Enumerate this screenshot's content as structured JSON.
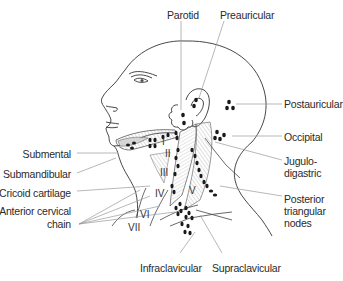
{
  "diagram": {
    "labels": {
      "parotid": "Parotid",
      "preauricular": "Preauricular",
      "postauricular": "Postauricular",
      "occipital": "Occipital",
      "jugulodigastric_1": "Jugulo-",
      "jugulodigastric_2": "digastric",
      "posterior_triangular_1": "Posterior",
      "posterior_triangular_2": "triangular",
      "posterior_triangular_3": "nodes",
      "submental": "Submental",
      "submandibular": "Submandibular",
      "cricoid_cartilage": "Cricoid cartilage",
      "anterior_cervical_1": "Anterior cervical",
      "anterior_cervical_2": "chain",
      "infraclavicular": "Infraclavicular",
      "supraclavicular": "Supraclavicular"
    },
    "levels": {
      "I": "I",
      "II": "II",
      "III": "III",
      "IV": "IV",
      "V": "V",
      "VI": "VI",
      "VII": "VII"
    },
    "colors": {
      "line": "#333333",
      "leader": "#9a9a9a",
      "node": "#1a1a1a",
      "hatch": "#b5b5b5",
      "shade": "#d9d9d9"
    }
  }
}
